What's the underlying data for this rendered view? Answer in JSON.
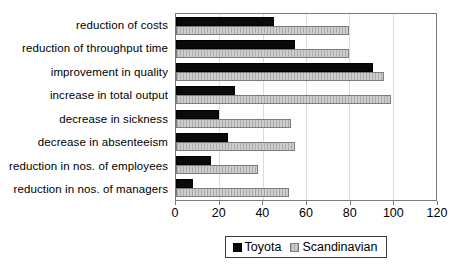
{
  "chart_data": {
    "type": "bar",
    "orientation": "horizontal",
    "categories": [
      "reduction of costs",
      "reduction of throughput time",
      "improvement in quality",
      "increase in total output",
      "decrease in sickness",
      "decrease in absenteeism",
      "reduction in nos. of employees",
      "reduction in nos. of managers"
    ],
    "series": [
      {
        "name": "Toyota",
        "color": "#000000",
        "pattern": "solid",
        "values": [
          45,
          55,
          91,
          27,
          20,
          24,
          16,
          8
        ]
      },
      {
        "name": "Scandinavian",
        "color": "#cecece",
        "pattern": "vertical-hatch",
        "hatch_color": "#aaaaaa",
        "values": [
          80,
          80,
          96,
          99,
          53,
          55,
          38,
          52
        ]
      }
    ],
    "xlabel": "",
    "ylabel": "",
    "xlim": [
      0,
      120
    ],
    "xticks": [
      0,
      20,
      40,
      60,
      80,
      100,
      120
    ],
    "grid": "vertical-major",
    "gridline_color": "#dcdcdc",
    "plot_border_color": "#7a7a7a",
    "legend_position": "bottom-center"
  }
}
